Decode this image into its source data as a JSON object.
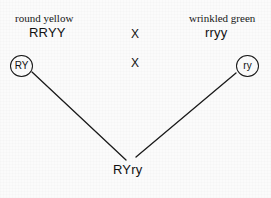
{
  "figure": {
    "type": "genetic-cross-diagram",
    "background_color": "#fbfbfb",
    "line_color": "#1a1a1a",
    "text_color": "#171717",
    "width": 271,
    "height": 198
  },
  "parents": {
    "left": {
      "phenotype": "round yellow",
      "genotype": "RRYY",
      "gamete": "RY"
    },
    "right": {
      "phenotype": "wrinkled green",
      "genotype": "rryy",
      "gamete": "ry"
    }
  },
  "cross_symbols": {
    "top": "X",
    "bottom": "X"
  },
  "offspring": {
    "genotype": "RYry"
  },
  "connectors": [
    {
      "name": "left-gamete-to-offspring",
      "x1": 32,
      "y1": 72,
      "x2": 126,
      "y2": 160
    },
    {
      "name": "right-gamete-to-offspring",
      "x1": 236,
      "y1": 73,
      "x2": 136,
      "y2": 157
    }
  ]
}
